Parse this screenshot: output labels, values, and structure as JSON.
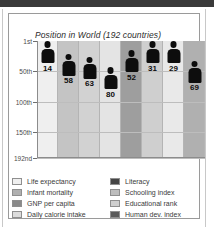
{
  "chart_data": {
    "type": "bar",
    "title": "Position in World (192 countries)",
    "xlabel": "",
    "ylabel": "",
    "grid": true,
    "legend_position": "bottom",
    "ylim": [
      1,
      192
    ],
    "y_tick_labels": [
      "1st",
      "50th",
      "100th",
      "150th",
      "192nd"
    ],
    "y_tick_values": [
      1,
      50,
      100,
      150,
      192
    ],
    "categories": [
      "Life expectancy",
      "Infant mortality",
      "GNP per capita",
      "Daily calorie intake",
      "Literacy",
      "Schooling index",
      "Educational rank",
      "Human dev. index"
    ],
    "values": [
      14,
      58,
      63,
      80,
      52,
      31,
      29,
      69
    ],
    "value_labels": [
      "14",
      "58",
      "63",
      "80",
      "52",
      "31",
      "29",
      "69"
    ],
    "band_colors": [
      "#efefef",
      "#c4c4c4",
      "#d2d2d2",
      "#e4e4e4",
      "#9e9e9e",
      "#cfcfcf",
      "#e9e9e9",
      "#b0b0b0"
    ]
  },
  "legend": {
    "left_column": [
      {
        "label": "Life expectancy",
        "color": "#efefef"
      },
      {
        "label": "Infant mortality",
        "color": "#b0b0b0"
      },
      {
        "label": "GNP per capita",
        "color": "#8a8a8a"
      },
      {
        "label": "Daily calorie intake",
        "color": "#dcdcdc"
      }
    ],
    "right_column": [
      {
        "label": "Literacy",
        "color": "#454545"
      },
      {
        "label": "Schooling index",
        "color": "#bdbdbd"
      },
      {
        "label": "Educational rank",
        "color": "#cfcfcf"
      },
      {
        "label": "Human dev. index",
        "color": "#5a5a5a"
      }
    ]
  }
}
